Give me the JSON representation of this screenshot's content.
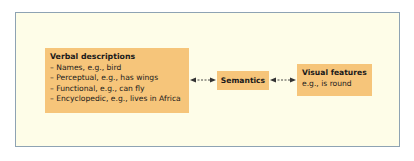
{
  "diagram": {
    "nodes": {
      "verbal": {
        "title": "Verbal descriptions",
        "items": [
          "– Names, e.g., bird",
          "– Perceptual, e.g., has wings",
          "– Functional, e.g., can fly",
          "– Encyclopedic, e.g., lives in Africa"
        ]
      },
      "semantics": {
        "title": "Semantics"
      },
      "visual": {
        "title": "Visual features",
        "example": "e.g., is round"
      }
    },
    "edges": [
      {
        "from": "verbal",
        "to": "semantics",
        "style": "dashed",
        "direction": "bidirectional"
      },
      {
        "from": "semantics",
        "to": "visual",
        "style": "dashed",
        "direction": "bidirectional"
      }
    ],
    "colors": {
      "box_fill": "#f6c57a",
      "background": "#fefde8",
      "frame_border": "#8ea3b3"
    }
  }
}
